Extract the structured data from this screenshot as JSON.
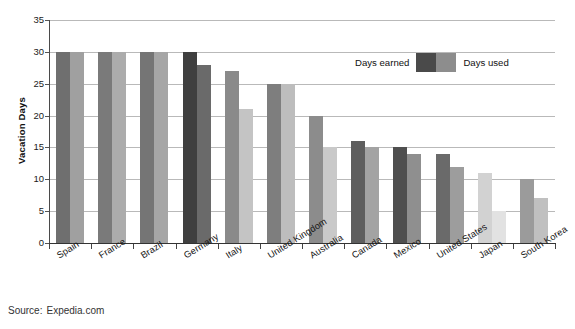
{
  "chart_data": {
    "type": "bar",
    "title": "Average Vacation Days Earned and Used per Year, by Country",
    "xlabel": "",
    "ylabel": "Vacation Days",
    "ylim": [
      0,
      35
    ],
    "yticks": [
      0,
      5,
      10,
      15,
      20,
      25,
      30,
      35
    ],
    "grid": true,
    "legend_position": "upper right (inside plot)",
    "categories": [
      "Spain",
      "France",
      "Brazil",
      "Germany",
      "Italy",
      "United Kingdom",
      "Australia",
      "Canada",
      "Mexico",
      "United States",
      "Japan",
      "South Korea"
    ],
    "series": [
      {
        "name": "Days earned",
        "values": [
          30,
          30,
          30,
          30,
          27,
          25,
          20,
          16,
          15,
          14,
          11,
          10
        ]
      },
      {
        "name": "Days used",
        "values": [
          30,
          30,
          30,
          28,
          21,
          25,
          15,
          15,
          14,
          12,
          5,
          7
        ]
      }
    ],
    "bar_colors_earned": [
      "#6f6f6f",
      "#7a7a7a",
      "#757575",
      "#3f3f3f",
      "#8a8a8a",
      "#7e7e7e",
      "#8c8c8c",
      "#5e5e5e",
      "#4f4f4f",
      "#6a6a6a",
      "#d2d2d2",
      "#9b9b9b"
    ],
    "bar_colors_used": [
      "#a0a0a0",
      "#acacac",
      "#a6a6a6",
      "#6a6a6a",
      "#c4c4c4",
      "#bdbdbd",
      "#c9c9c9",
      "#a3a3a3",
      "#8f8f8f",
      "#9d9d9d",
      "#e2e2e2",
      "#c0c0c0"
    ],
    "source": "Source:",
    "source_value": "Expedia.com"
  },
  "legend": {
    "earned_label": "Days earned",
    "used_label": "Days used",
    "earned_color": "#4a4a4a",
    "used_color": "#8d8d8d"
  },
  "axis": {
    "y_title": "Vacation Days",
    "y_tick_labels": [
      "35",
      "30",
      "25",
      "20",
      "15",
      "10",
      "5",
      "0"
    ]
  }
}
